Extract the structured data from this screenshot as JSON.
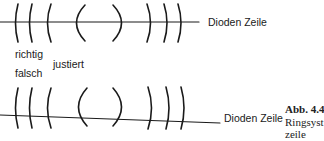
{
  "figure": {
    "top_diagram": {
      "line_label": "Dioden Zeile",
      "state_label_1": "richtig",
      "state_label_2": "justiert"
    },
    "bottom_diagram": {
      "line_label": "Dioden Zeile",
      "state_label": "falsch"
    },
    "caption": {
      "number": "Abb. 4.4",
      "line1": "Ringsyst",
      "line2": "zeile"
    },
    "colors": {
      "ink": "#1a1a1a",
      "background": "#ffffff"
    }
  }
}
